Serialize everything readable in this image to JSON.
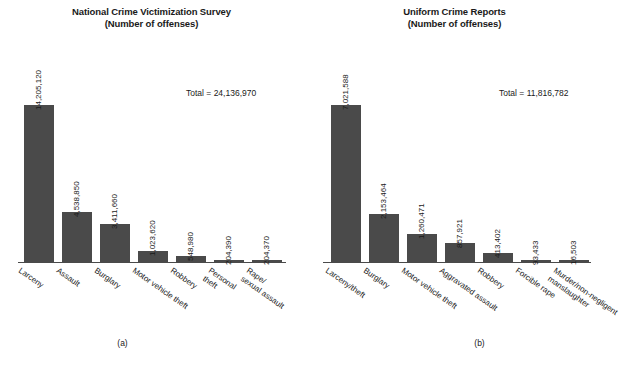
{
  "figure": {
    "background": "#ffffff",
    "bar_color": "#4a4a4a",
    "axis_color": "#4a4a4a"
  },
  "panels": [
    {
      "caption": "(a)",
      "title_line1": "National Crime Victimization Survey",
      "title_line2": "(Number of offenses)",
      "total_label": "Total = 24,136,970"
    },
    {
      "caption": "(b)",
      "title_line1": "Uniform Crime Reports",
      "title_line2": "(Number of offenses)",
      "total_label": "Total = 11,816,782"
    }
  ],
  "chart_data": [
    {
      "type": "bar",
      "title": "National Crime Victimization Survey (Number of offenses)",
      "subtitle": "(Number of offenses)",
      "panel": "(a)",
      "xlabel": "",
      "ylabel": "",
      "grid": false,
      "legend": "none",
      "ylim": [
        0,
        14205120
      ],
      "total": 24136970,
      "total_label": "Total = 24,136,970",
      "categories": [
        "Larceny",
        "Assault",
        "Burglary",
        "Motor vehicle theft",
        "Robbery",
        "Personal theft",
        "Rape/ sexual assault"
      ],
      "category_lines": [
        [
          "Larceny"
        ],
        [
          "Assault"
        ],
        [
          "Burglary"
        ],
        [
          "Motor vehicle theft"
        ],
        [
          "Robbery"
        ],
        [
          "Personal",
          "theft"
        ],
        [
          "Rape/",
          "sexual assault"
        ]
      ],
      "values": [
        14205120,
        4538850,
        3411660,
        1023620,
        548980,
        204390,
        204370
      ],
      "value_labels": [
        "14,205,120",
        "4,538,850",
        "3,411,660",
        "1,023,620",
        "548,980",
        "204,390",
        "204,370"
      ]
    },
    {
      "type": "bar",
      "title": "Uniform Crime Reports (Number of offenses)",
      "subtitle": "(Number of offenses)",
      "panel": "(b)",
      "xlabel": "",
      "ylabel": "",
      "grid": false,
      "legend": "none",
      "ylim": [
        0,
        7021588
      ],
      "total": 11816782,
      "total_label": "Total = 11,816,782",
      "categories": [
        "Larceny/theft",
        "Burglary",
        "Motor vehicle theft",
        "Aggravated assault",
        "Robbery",
        "Forcible rape",
        "Murder/non-negligent manslaughter"
      ],
      "category_lines": [
        [
          "Larceny/theft"
        ],
        [
          "Burglary"
        ],
        [
          "Motor vehicle theft"
        ],
        [
          "Aggravated assault"
        ],
        [
          "Robbery"
        ],
        [
          "Forcible rape"
        ],
        [
          "Murder/non-negligent",
          "manslaughter"
        ]
      ],
      "values": [
        7021588,
        2153464,
        1260471,
        857921,
        413402,
        93433,
        16503
      ],
      "value_labels": [
        "7,021,588",
        "2,153,464",
        "1,260,471",
        "857,921",
        "413,402",
        "93,433",
        "16,503"
      ]
    }
  ]
}
